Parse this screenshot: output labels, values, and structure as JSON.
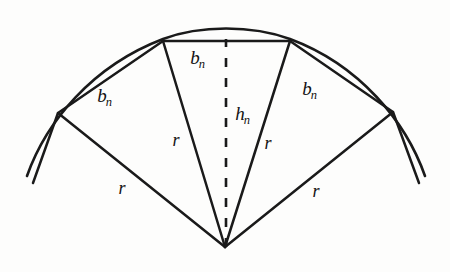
{
  "figure": {
    "background_color": "#fdfdfc",
    "stroke_color": "#1a1a1a",
    "dash_color": "#1a1a1a",
    "labels": {
      "chord_left": {
        "base": "b",
        "sub": "n",
        "x": 105,
        "y": 95
      },
      "chord_middle": {
        "base": "b",
        "sub": "n",
        "x": 198,
        "y": 57
      },
      "chord_right": {
        "base": "b",
        "sub": "n",
        "x": 310,
        "y": 88
      },
      "apothem": {
        "base": "h",
        "sub": "n",
        "x": 243,
        "y": 113
      },
      "radius_inner_left": {
        "base": "r",
        "x": 176,
        "y": 140
      },
      "radius_inner_right": {
        "base": "r",
        "x": 268,
        "y": 143
      },
      "radius_outer_left": {
        "base": "r",
        "x": 122,
        "y": 188
      },
      "radius_outer_right": {
        "base": "r",
        "x": 316,
        "y": 191
      }
    },
    "geometry": {
      "center": {
        "x": 225,
        "y": 247
      },
      "circle_radius": 206,
      "arc_points": [
        {
          "x": 58,
          "y": 113
        },
        {
          "x": 163,
          "y": 41
        },
        {
          "x": 290,
          "y": 41
        },
        {
          "x": 393,
          "y": 112
        }
      ],
      "arc_tail_left": {
        "x": 27,
        "y": 176
      },
      "arc_tail_right": {
        "x": 425,
        "y": 176
      },
      "apothem_top": {
        "x": 226,
        "y": 40
      },
      "arc_apex": {
        "x": 226,
        "y": 27
      }
    }
  }
}
